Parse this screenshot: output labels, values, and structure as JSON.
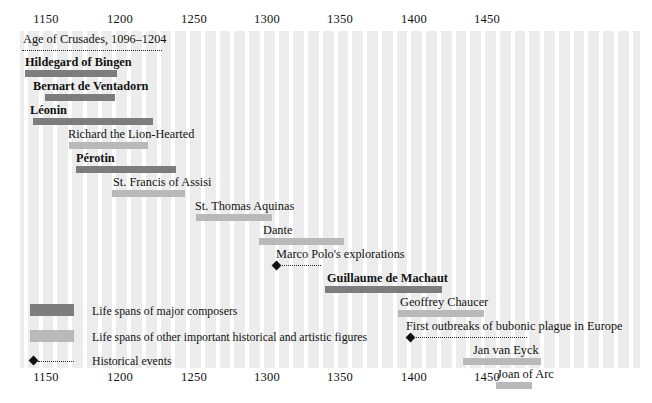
{
  "chart_data": {
    "type": "bar",
    "title": "",
    "xlabel": "",
    "ylabel": "",
    "xlim": [
      1090,
      1510
    ],
    "grid": true,
    "legend_position": "bottom-left",
    "axis": {
      "ticks": [
        1150,
        1200,
        1250,
        1300,
        1350,
        1400,
        1450
      ],
      "tick_labels": [
        "1150",
        "1200",
        "1250",
        "1300",
        "1350",
        "1400",
        "1450"
      ],
      "top_axis": true,
      "bottom_axis": true
    },
    "categories": [
      "Age of Crusades, 1096–1204",
      "Hildegard of Bingen",
      "Bernart de Ventadorn",
      "Léonin",
      "Richard the Lion-Hearted",
      "Pérotin",
      "St. Francis of Assisi",
      "St. Thomas Aquinas",
      "Dante",
      "Marco Polo's explorations",
      "Guillaume de Machaut",
      "Geoffrey Chaucer",
      "First outbreaks of bubonic plague in Europe",
      "Jan van Eyck",
      "Joan of Arc"
    ],
    "series": [
      {
        "name": "Life spans of major composers",
        "color": "#7d7d7d",
        "items": [
          {
            "label": "Hildegard of Bingen",
            "start": 1098,
            "end": 1179
          },
          {
            "label": "Bernart de Ventadorn",
            "start": 1135,
            "end": 1195
          },
          {
            "label": "Léonin",
            "start": 1135,
            "end": 1201
          },
          {
            "label": "Pérotin",
            "start": 1170,
            "end": 1236
          },
          {
            "label": "Guillaume de Machaut",
            "start": 1300,
            "end": 1377
          }
        ]
      },
      {
        "name": "Life spans of other important historical and artistic figures",
        "color": "#b9b9b9",
        "items": [
          {
            "label": "Richard the Lion-Hearted",
            "start": 1157,
            "end": 1199
          },
          {
            "label": "St. Francis of Assisi",
            "start": 1182,
            "end": 1226
          },
          {
            "label": "St. Thomas Aquinas",
            "start": 1225,
            "end": 1274
          },
          {
            "label": "Dante",
            "start": 1265,
            "end": 1321
          },
          {
            "label": "Geoffrey Chaucer",
            "start": 1343,
            "end": 1400
          },
          {
            "label": "Jan van Eyck",
            "start": 1390,
            "end": 1441
          },
          {
            "label": "Joan of Arc",
            "start": 1412,
            "end": 1431
          }
        ]
      },
      {
        "name": "Historical events",
        "color": "#111111",
        "items": [
          {
            "label": "Age of Crusades, 1096–1204",
            "start": 1096,
            "end": 1204
          },
          {
            "label": "Marco Polo's explorations",
            "start": 1271,
            "end": 1300
          },
          {
            "label": "First outbreaks of bubonic plague in Europe",
            "start": 1347,
            "end": 1425
          }
        ]
      }
    ]
  },
  "rows": [
    {
      "name": "age-of-crusades",
      "label": "Age of Crusades, 1096–1204",
      "type": "event",
      "bold": false,
      "label_x": 23,
      "line_x": 22,
      "line_w": 140,
      "dot": false,
      "y": 1
    },
    {
      "name": "hildegard-of-bingen",
      "label": "Hildegard of Bingen",
      "type": "composer",
      "bold": true,
      "label_x": 25,
      "bar_x": 25,
      "bar_w": 92,
      "y": 24
    },
    {
      "name": "bernart-de-ventadorn",
      "label": "Bernart de Ventadorn",
      "type": "composer",
      "bold": true,
      "label_x": 33,
      "bar_x": 45,
      "bar_w": 70,
      "y": 48
    },
    {
      "name": "leonin",
      "label": "Léonin",
      "type": "composer",
      "bold": true,
      "label_x": 30,
      "bar_x": 33,
      "bar_w": 120,
      "y": 72
    },
    {
      "name": "richard-the-lion-hearted",
      "label": "Richard the Lion-Hearted",
      "type": "figure",
      "bold": false,
      "label_x": 68,
      "bar_x": 69,
      "bar_w": 79,
      "y": 96
    },
    {
      "name": "perotin",
      "label": "Pérotin",
      "type": "composer",
      "bold": true,
      "label_x": 76,
      "bar_x": 76,
      "bar_w": 100,
      "y": 120
    },
    {
      "name": "st-francis-of-assisi",
      "label": "St. Francis of Assisi",
      "type": "figure",
      "bold": false,
      "label_x": 113,
      "bar_x": 112,
      "bar_w": 73,
      "y": 144
    },
    {
      "name": "st-thomas-aquinas",
      "label": "St. Thomas Aquinas",
      "type": "figure",
      "bold": false,
      "label_x": 195,
      "bar_x": 196,
      "bar_w": 76,
      "y": 168
    },
    {
      "name": "dante",
      "label": "Dante",
      "type": "figure",
      "bold": false,
      "label_x": 263,
      "bar_x": 259,
      "bar_w": 85,
      "y": 192
    },
    {
      "name": "marco-polo-explorations",
      "label": "Marco Polo's explorations",
      "type": "event",
      "bold": false,
      "label_x": 276,
      "line_x": 279,
      "line_w": 42,
      "dot": true,
      "dot_x": 273,
      "y": 216
    },
    {
      "name": "guillaume-de-machaut",
      "label": "Guillaume de Machaut",
      "type": "composer",
      "bold": true,
      "label_x": 327,
      "bar_x": 325,
      "bar_w": 117,
      "y": 240
    },
    {
      "name": "geoffrey-chaucer",
      "label": "Geoffrey Chaucer",
      "type": "figure",
      "bold": false,
      "label_x": 400,
      "bar_x": 398,
      "bar_w": 86,
      "y": 264
    },
    {
      "name": "first-outbreaks-of-bubonic-plague",
      "label": "First outbreaks of bubonic plague in Europe",
      "type": "event",
      "bold": false,
      "label_x": 406,
      "line_x": 413,
      "line_w": 114,
      "dot": true,
      "dot_x": 407,
      "y": 288
    },
    {
      "name": "jan-van-eyck",
      "label": "Jan van Eyck",
      "type": "figure",
      "bold": false,
      "label_x": 473,
      "bar_x": 463,
      "bar_w": 78,
      "y": 312
    },
    {
      "name": "joan-of-arc",
      "label": "Joan of Arc",
      "type": "figure",
      "bold": false,
      "label_x": 497,
      "bar_x": 496,
      "bar_w": 36,
      "y": 336
    }
  ],
  "axis": {
    "ticks": [
      {
        "label": "1150",
        "x": 46
      },
      {
        "label": "1200",
        "x": 120
      },
      {
        "label": "1250",
        "x": 194
      },
      {
        "label": "1300",
        "x": 267
      },
      {
        "label": "1350",
        "x": 340
      },
      {
        "label": "1400",
        "x": 414
      },
      {
        "label": "1450",
        "x": 487
      }
    ]
  },
  "legend": {
    "composers": "Life spans of major composers",
    "figures": "Life spans of other important historical and artistic figures",
    "events": "Historical events"
  },
  "colors": {
    "composer_bar": "#7d7d7d",
    "figure_bar": "#b9b9b9",
    "event_marker": "#111111",
    "band": "#ececec",
    "stripe": "#ffffff"
  }
}
